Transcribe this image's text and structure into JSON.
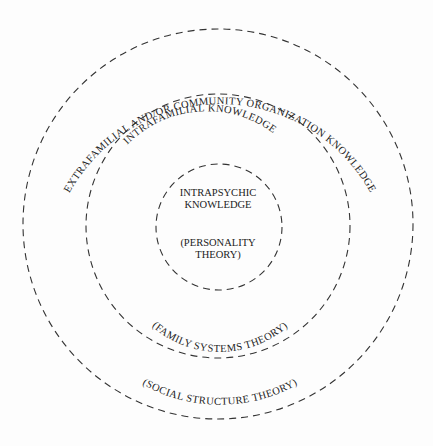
{
  "diagram": {
    "rings": [
      {
        "name": "outer",
        "label_top": "EXTRAFAMILIAL AND/OR COMMUNITY ORGANIZATION KNOWLEDGE",
        "label_bottom": "(SOCIAL STRUCTURE THEORY)"
      },
      {
        "name": "middle",
        "label_top": "INTRAFAMILIAL KNOWLEDGE",
        "label_bottom": "(FAMILY SYSTEMS THEORY)"
      },
      {
        "name": "inner",
        "label_line1": "INTRAPSYCHIC",
        "label_line2": "KNOWLEDGE",
        "sub_line1": "(PERSONALITY",
        "sub_line2": "THEORY)"
      }
    ],
    "stroke_color": "#333333",
    "text_color": "#222222",
    "background": "#fdfdfd"
  }
}
